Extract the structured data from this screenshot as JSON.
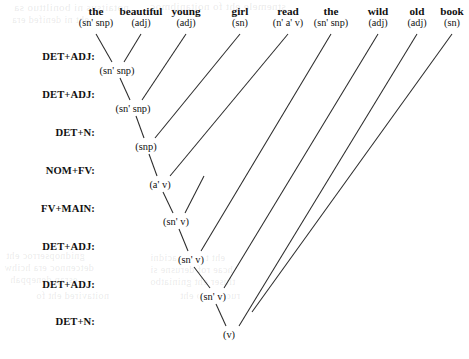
{
  "diagram": {
    "ink_color": "#2b2b2b",
    "background": "#ffffff"
  },
  "words": [
    {
      "surface": "the",
      "category": "(sn' snp)",
      "x": 96,
      "y": 14
    },
    {
      "surface": "beautiful",
      "category": "(adj)",
      "x": 141,
      "y": 14
    },
    {
      "surface": "young",
      "category": "(adj)",
      "x": 186,
      "y": 14
    },
    {
      "surface": "girl",
      "category": "(sn)",
      "x": 240,
      "y": 14
    },
    {
      "surface": "read",
      "category": "(n' a' v)",
      "x": 288,
      "y": 14
    },
    {
      "surface": "the",
      "category": "(sn' snp)",
      "x": 331,
      "y": 14
    },
    {
      "surface": "wild",
      "category": "(adj)",
      "x": 378,
      "y": 14
    },
    {
      "surface": "old",
      "category": "(adj)",
      "x": 417,
      "y": 14
    },
    {
      "surface": "book",
      "category": "(sn)",
      "x": 452,
      "y": 14
    }
  ],
  "steps": [
    {
      "label": "DET+ADJ:",
      "y": 56
    },
    {
      "label": "DET+ADJ:",
      "y": 94
    },
    {
      "label": "DET+N:",
      "y": 132
    },
    {
      "label": "NOM+FV:",
      "y": 170
    },
    {
      "label": "FV+MAIN:",
      "y": 208
    },
    {
      "label": "DET+ADJ:",
      "y": 246
    },
    {
      "label": "DET+ADJ:",
      "y": 284
    },
    {
      "label": "DET+N:",
      "y": 321
    }
  ],
  "nodes": [
    {
      "label": "(sn' snp)",
      "x": 117,
      "y": 70
    },
    {
      "label": "(sn' snp)",
      "x": 133,
      "y": 108
    },
    {
      "label": "(snp)",
      "x": 146,
      "y": 146
    },
    {
      "label": "(a' v)",
      "x": 160,
      "y": 184
    },
    {
      "label": "(sn' v)",
      "x": 176,
      "y": 221
    },
    {
      "label": "(sn' v)",
      "x": 191,
      "y": 259
    },
    {
      "label": "(sn' v)",
      "x": 213,
      "y": 296
    },
    {
      "label": "(v)",
      "x": 229,
      "y": 334
    }
  ],
  "edges": [
    {
      "from": "word-the-1",
      "x1": 96,
      "y1": 34,
      "x2": 112,
      "y2": 62
    },
    {
      "from": "word-beautiful",
      "x1": 141,
      "y1": 34,
      "x2": 124,
      "y2": 62
    },
    {
      "from": "node-1",
      "x1": 120,
      "y1": 78,
      "x2": 130,
      "y2": 100
    },
    {
      "from": "word-young",
      "x1": 186,
      "y1": 34,
      "x2": 142,
      "y2": 100
    },
    {
      "from": "node-2",
      "x1": 136,
      "y1": 116,
      "x2": 144,
      "y2": 138
    },
    {
      "from": "word-girl",
      "x1": 240,
      "y1": 34,
      "x2": 155,
      "y2": 138
    },
    {
      "from": "node-3",
      "x1": 149,
      "y1": 154,
      "x2": 157,
      "y2": 176
    },
    {
      "from": "word-read",
      "x1": 288,
      "y1": 34,
      "x2": 170,
      "y2": 176
    },
    {
      "from": "node-4",
      "x1": 163,
      "y1": 192,
      "x2": 173,
      "y2": 213
    },
    {
      "from": "spine-4-right",
      "x1": 204,
      "y1": 176,
      "x2": 185,
      "y2": 213
    },
    {
      "from": "node-5",
      "x1": 179,
      "y1": 229,
      "x2": 188,
      "y2": 251
    },
    {
      "from": "word-the-2",
      "x1": 331,
      "y1": 34,
      "x2": 201,
      "y2": 251
    },
    {
      "from": "node-6",
      "x1": 194,
      "y1": 267,
      "x2": 210,
      "y2": 288
    },
    {
      "from": "word-wild",
      "x1": 378,
      "y1": 34,
      "x2": 224,
      "y2": 288
    },
    {
      "from": "node-7",
      "x1": 216,
      "y1": 304,
      "x2": 226,
      "y2": 326
    },
    {
      "from": "word-old",
      "x1": 417,
      "y1": 34,
      "x2": 239,
      "y2": 326
    },
    {
      "from": "word-book",
      "x1": 452,
      "y1": 34,
      "x2": 252,
      "y2": 312
    }
  ],
  "ghost_lines": [
    {
      "text": "notaitsus ni bonilttuo sa",
      "x": 14,
      "y": 1,
      "size": 11
    },
    {
      "text": "stnemele eht fo noitanibmoc",
      "x": 150,
      "y": 0,
      "size": 11
    },
    {
      "text": "eht ni denifed era",
      "x": 12,
      "y": 14,
      "size": 10
    },
    {
      "text": "gnidnopserroc eht",
      "x": 6,
      "y": 250,
      "size": 10
    },
    {
      "text": "detcennoc era hcihw",
      "x": 4,
      "y": 262,
      "size": 10
    },
    {
      "text": "esrap deneppah",
      "x": 10,
      "y": 274,
      "size": 10
    },
    {
      "text": "eht taht setacidni",
      "x": 150,
      "y": 252,
      "size": 10
    },
    {
      "text": "hcae rof derusne si",
      "x": 150,
      "y": 264,
      "size": 10
    },
    {
      "text": "tluser eht gniniatbo",
      "x": 150,
      "y": 276,
      "size": 10
    },
    {
      "text": "noitavired eht fo",
      "x": 36,
      "y": 290,
      "size": 10
    },
    {
      "text": "ruoivaheb eht",
      "x": 180,
      "y": 290,
      "size": 10
    }
  ]
}
